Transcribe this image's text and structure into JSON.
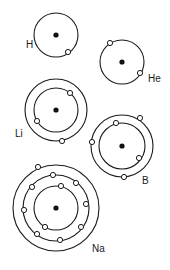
{
  "diagram": {
    "title": "",
    "colors": {
      "line": "#1a1a1a",
      "nucleus": "#111111",
      "electron_fill": "#ffffff",
      "background": "#ffffff"
    },
    "atoms": [
      {
        "symbol": "H",
        "label": "H",
        "center": [
          56,
          35
        ],
        "shells": [
          22
        ],
        "electrons_per_shell": [
          1
        ],
        "label_pos": [
          26,
          48
        ],
        "electrons": [
          [
            68,
            52
          ]
        ]
      },
      {
        "symbol": "He",
        "label": "He",
        "center": [
          122,
          62
        ],
        "shells": [
          22
        ],
        "electrons_per_shell": [
          2
        ],
        "label_pos": [
          148,
          82
        ],
        "electrons": [
          [
            110,
            43
          ],
          [
            140,
            73
          ]
        ]
      },
      {
        "symbol": "Li",
        "label": "Li",
        "center": [
          56,
          110
        ],
        "shells": [
          22,
          31
        ],
        "electrons_per_shell": [
          2,
          1
        ],
        "label_pos": [
          15,
          137
        ],
        "electrons": [
          [
            70,
            93
          ],
          [
            37,
            121
          ],
          [
            62,
            141
          ]
        ]
      },
      {
        "symbol": "B",
        "label": "B",
        "center": [
          122,
          146
        ],
        "shells": [
          23,
          31
        ],
        "electrons_per_shell": [
          2,
          3
        ],
        "label_pos": [
          142,
          184
        ],
        "electrons": [
          [
            116,
            123
          ],
          [
            139,
            158
          ],
          [
            140,
            118
          ],
          [
            124,
            177
          ],
          [
            92,
            142
          ]
        ]
      },
      {
        "symbol": "Na",
        "label": "Na",
        "center": [
          56,
          208
        ],
        "shells": [
          22,
          33,
          43
        ],
        "electrons_per_shell": [
          2,
          8,
          1
        ],
        "label_pos": [
          92,
          252
        ],
        "electrons": [
          [
            61,
            186
          ],
          [
            45,
            227
          ],
          [
            53,
            175
          ],
          [
            32,
            187
          ],
          [
            76,
            183
          ],
          [
            86,
            204
          ],
          [
            24,
            210
          ],
          [
            81,
            227
          ],
          [
            37,
            234
          ],
          [
            60,
            240
          ],
          [
            38,
            167
          ]
        ]
      }
    ]
  }
}
